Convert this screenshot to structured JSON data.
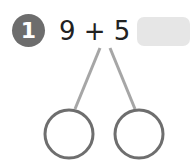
{
  "problem": {
    "number": "1",
    "equation": "9 + 5 =",
    "answer": ""
  },
  "number_bond": {
    "parts": [
      "",
      ""
    ]
  },
  "colors": {
    "badge": "#6d6d6d",
    "answer_box": "#e6e6e6",
    "bond_line": "#a6a6a6",
    "circle_stroke": "#6e6e6e"
  }
}
